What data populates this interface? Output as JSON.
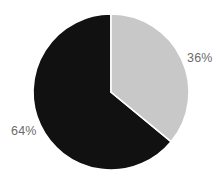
{
  "chart_data": {
    "type": "pie",
    "title": "",
    "subtitle": "",
    "xlabel": "",
    "ylabel": "",
    "grid": false,
    "legend": "none",
    "labels_position": "outside",
    "start_angle_deg": 0,
    "direction": "clockwise",
    "categories": [
      "Segment A",
      "Segment B"
    ],
    "values": [
      64,
      36
    ],
    "slices": [
      {
        "name": "Segment A",
        "value": 64,
        "label": "64%",
        "color": "#111111",
        "start_angle_deg": 129.6,
        "end_angle_deg": 360.0
      },
      {
        "name": "Segment B",
        "value": 36,
        "label": "36%",
        "color": "#c8c8c8",
        "start_angle_deg": 0.0,
        "end_angle_deg": 129.6
      }
    ],
    "geometry": {
      "center_x": 111,
      "center_y": 92,
      "radius": 78
    },
    "colors": {
      "background": "#ffffff",
      "dark_slice": "#111111",
      "light_slice": "#c8c8c8",
      "separator": "#ffffff",
      "label_text": "#6b6b6b"
    }
  }
}
